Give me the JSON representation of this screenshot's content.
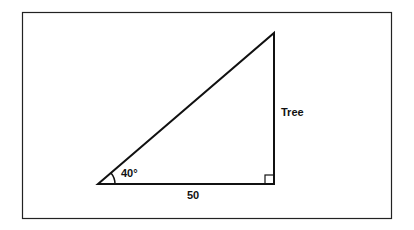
{
  "diagram": {
    "type": "right-triangle",
    "labels": {
      "angle": "40°",
      "base": "50",
      "height": "Tree"
    },
    "colors": {
      "stroke": "#111111",
      "background": "#ffffff"
    }
  }
}
